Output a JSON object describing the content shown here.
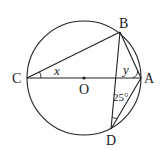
{
  "diagram": {
    "circle": {
      "center_label": "O",
      "cx": 84,
      "cy": 78,
      "r": 57
    },
    "points": {
      "A": {
        "label": "A",
        "x": 141,
        "y": 78
      },
      "B": {
        "label": "B",
        "x": 120,
        "y": 32
      },
      "C": {
        "label": "C",
        "x": 27,
        "y": 78
      },
      "D": {
        "label": "D",
        "x": 111,
        "y": 129
      },
      "O": {
        "label": "O",
        "x": 84,
        "y": 78
      }
    },
    "segments": [
      "CA",
      "CB",
      "BA",
      "BD",
      "DA"
    ],
    "angles": {
      "x": {
        "label": "x",
        "vertex": "C"
      },
      "y": {
        "label": "y",
        "vertex": "A"
      },
      "d": {
        "label": "25°",
        "vertex": "D"
      }
    },
    "stroke_color": "#222222"
  }
}
